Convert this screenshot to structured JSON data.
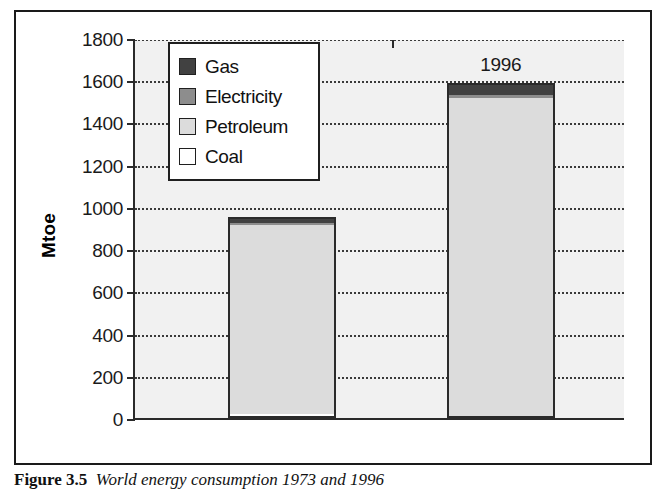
{
  "figure": {
    "caption_label": "Figure 3.5",
    "caption_text": "World energy consumption 1973 and 1996"
  },
  "legend": {
    "items": [
      {
        "label": "Gas",
        "color": "#414141",
        "swatch": "gas-swatch"
      },
      {
        "label": "Electricity",
        "color": "#8d8d8d",
        "swatch": "electricity-swatch"
      },
      {
        "label": "Petroleum",
        "color": "#dcdcdc",
        "swatch": "petroleum-swatch"
      },
      {
        "label": "Coal",
        "color": "#ffffff",
        "swatch": "coal-swatch"
      }
    ]
  },
  "axes": {
    "y_title": "Mtoe",
    "y_ticks": [
      "0",
      "200",
      "400",
      "600",
      "800",
      "1000",
      "1200",
      "1400",
      "1600",
      "1800"
    ],
    "x_ticks": [
      "1973",
      "1996"
    ]
  },
  "chart_data": {
    "type": "bar",
    "subtype": "stacked",
    "title": "World energy consumption 1973 and 1996",
    "xlabel": "",
    "ylabel": "Mtoe",
    "ylim": [
      0,
      1800
    ],
    "ytick_step": 200,
    "grid": true,
    "grid_style": "dotted-horizontal",
    "legend_position": "upper-left-inside",
    "categories": [
      "1973",
      "1996"
    ],
    "series": [
      {
        "name": "Coal",
        "color": "#ffffff",
        "values": [
          20,
          10
        ]
      },
      {
        "name": "Petroleum",
        "color": "#dcdcdc",
        "values": [
          900,
          1505
        ]
      },
      {
        "name": "Electricity",
        "color": "#8d8d8d",
        "values": [
          5,
          15
        ]
      },
      {
        "name": "Gas",
        "color": "#414141",
        "values": [
          25,
          55
        ]
      }
    ],
    "totals": [
      950,
      1585
    ]
  }
}
